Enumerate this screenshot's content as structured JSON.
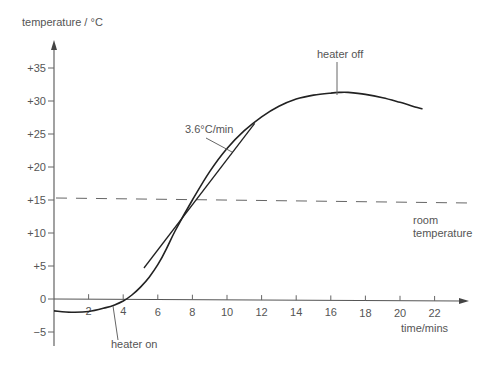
{
  "chart_data": {
    "type": "line",
    "title": "",
    "ylabel": "temperature / °C",
    "xlabel": "time/mins",
    "xlim": [
      0,
      23
    ],
    "ylim": [
      -7,
      38
    ],
    "grid": false,
    "legend": null,
    "x_ticks": [
      2,
      4,
      6,
      8,
      10,
      12,
      14,
      16,
      18,
      20,
      22
    ],
    "x_tick_labels": [
      "2",
      "4",
      "6",
      "8",
      "10",
      "12",
      "14",
      "16",
      "18",
      "20",
      "22"
    ],
    "y_ticks": [
      35,
      30,
      25,
      20,
      15,
      10,
      5,
      0,
      -5
    ],
    "y_tick_labels": [
      "+35",
      "+30",
      "+25",
      "+20",
      "+15",
      "+10",
      "+5",
      "0",
      "−5"
    ],
    "series": [
      {
        "name": "temperature",
        "style": "solid",
        "x": [
          0,
          1,
          2,
          3,
          3.5,
          4,
          4.5,
          5,
          5.5,
          6,
          6.5,
          7,
          8,
          9,
          10,
          11,
          12,
          13,
          14,
          15,
          16,
          16.5,
          17,
          18,
          19,
          20,
          21,
          21.3
        ],
        "values": [
          -1.8,
          -2.0,
          -1.9,
          -1.3,
          -0.9,
          -0.3,
          0.6,
          1.8,
          3.3,
          5.2,
          7.6,
          10.3,
          15.0,
          19.3,
          22.8,
          25.5,
          27.6,
          29.2,
          30.3,
          30.9,
          31.2,
          31.3,
          31.3,
          31.0,
          30.5,
          29.8,
          29.0,
          28.8
        ]
      },
      {
        "name": "room temperature",
        "style": "dashed",
        "x": [
          0,
          23
        ],
        "values": [
          15.3,
          14.6
        ]
      },
      {
        "name": "tangent",
        "style": "solid",
        "x": [
          5.2,
          11.6
        ],
        "values": [
          4.7,
          26.6
        ]
      }
    ],
    "annotations": [
      {
        "text": "heater on",
        "x": 3.5,
        "y": -1.0
      },
      {
        "text": "heater off",
        "x": 16.6,
        "y": 31.3
      },
      {
        "text": "3.6°C/min",
        "x": 9.3,
        "y": 20.6,
        "note": "slope of tangent"
      },
      {
        "text": "room temperature",
        "x": 22,
        "y": 14.6
      }
    ]
  },
  "labels": {
    "y_axis_title": "temperature / °C",
    "x_axis_title": "time/mins",
    "heater_on": "heater on",
    "heater_off": "heater off",
    "slope": "3.6°C/min",
    "room_line1": "room",
    "room_line2": "temperature"
  }
}
